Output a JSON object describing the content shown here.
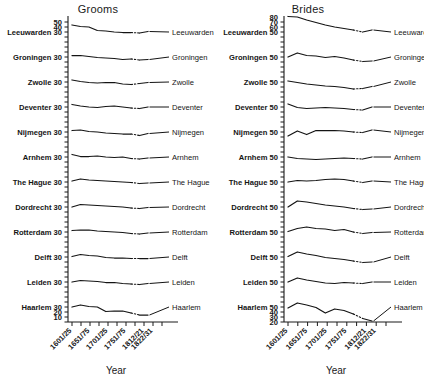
{
  "figure": {
    "background": "#ffffff",
    "ink_color": "#141414",
    "xlabel": "Year"
  },
  "panels": [
    {
      "key": "grooms",
      "title": "Grooms"
    },
    {
      "key": "brides",
      "title": "Brides"
    }
  ],
  "cities": [
    "Leeuwarden",
    "Groningen",
    "Zwolle",
    "Deventer",
    "Nijmegen",
    "Arnhem",
    "The Hague",
    "Dordrecht",
    "Rotterdam",
    "Delft",
    "Leiden",
    "Haarlem"
  ],
  "x_tick_labels": [
    "1601/25",
    "1651/75",
    "1701/25",
    "1751/75",
    "1812/21",
    "1822/31"
  ],
  "x_all_periods": [
    "1601/25",
    "1626/50",
    "1651/75",
    "1676/1700",
    "1701/25",
    "1726/50",
    "1751/75",
    "1776/1800",
    "1812/21",
    "1822/31"
  ],
  "chart_data": {
    "type": "line",
    "xlabel": "Year",
    "ylabel": "",
    "grid": false,
    "legend": "right-inline-labels",
    "x": [
      "1601/25",
      "1626/50",
      "1651/75",
      "1676/1700",
      "1701/25",
      "1726/50",
      "1751/75",
      "1776/1800",
      "1812/21",
      "1822/31"
    ],
    "x_tick_labels": [
      "1601/25",
      "1651/75",
      "1701/25",
      "1751/75",
      "1812/21",
      "1822/31"
    ],
    "panels": [
      {
        "name": "Grooms",
        "ylim": [
          10,
          55
        ],
        "yticks_labeled": [
          50,
          40,
          30
        ],
        "ytick_note": "Each city strip repeats a '30' reference tick; Leeuwarden strip also shows 50 and 40; Haarlem strip shows 30, 20, 10.",
        "series": [
          {
            "name": "Leeuwarden",
            "offset_label": 30,
            "values": [
              44,
              41,
              40,
              33,
              32,
              30,
              29,
              29,
              28,
              31
            ]
          },
          {
            "name": "Groningen",
            "offset_label": 30,
            "values": [
              33,
              33,
              31,
              29,
              28,
              27,
              25,
              26,
              24,
              25
            ]
          },
          {
            "name": "Zwolle",
            "offset_label": 30,
            "values": [
              34,
              31,
              29,
              28,
              29,
              29,
              26,
              25,
              27,
              29
            ]
          },
          {
            "name": "Deventer",
            "offset_label": 30,
            "values": [
              35,
              32,
              30,
              29,
              31,
              32,
              30,
              28,
              27,
              30
            ]
          },
          {
            "name": "Nijmegen",
            "offset_label": 30,
            "values": [
              33,
              34,
              31,
              30,
              28,
              27,
              26,
              26,
              23,
              27
            ]
          },
          {
            "name": "Arnhem",
            "offset_label": 30,
            "values": [
              35,
              31,
              31,
              32,
              30,
              29,
              30,
              27,
              26,
              28
            ]
          },
          {
            "name": "The Hague",
            "offset_label": 30,
            "values": [
              32,
              36,
              34,
              33,
              32,
              31,
              30,
              29,
              27,
              28
            ]
          },
          {
            "name": "Dordrecht",
            "offset_label": 30,
            "values": [
              30,
              35,
              34,
              33,
              32,
              31,
              30,
              28,
              27,
              29
            ]
          },
          {
            "name": "Rotterdam",
            "offset_label": 30,
            "values": [
              33,
              34,
              34,
              32,
              31,
              30,
              29,
              27,
              26,
              28
            ]
          },
          {
            "name": "Delft",
            "offset_label": 30,
            "values": [
              31,
              35,
              33,
              32,
              29,
              28,
              28,
              27,
              27,
              27
            ]
          },
          {
            "name": "Leiden",
            "offset_label": 30,
            "values": [
              30,
              33,
              32,
              31,
              29,
              29,
              27,
              26,
              25,
              27
            ]
          },
          {
            "name": "Haarlem",
            "offset_label": 30,
            "values": [
              30,
              34,
              31,
              30,
              21,
              22,
              22,
              18,
              14,
              14
            ]
          }
        ]
      },
      {
        "name": "Brides",
        "ylim": [
          20,
          85
        ],
        "yticks_labeled": [
          80,
          70,
          60,
          50
        ],
        "ytick_note": "Each city strip repeats a '50' reference tick; Leeuwarden strip also shows 80, 70, 60; Haarlem strip shows 50, 40, 30, 20.",
        "series": [
          {
            "name": "Leeuwarden",
            "offset_label": 50,
            "values": [
              81,
              80,
              74,
              69,
              64,
              60,
              57,
              54,
              50,
              54
            ]
          },
          {
            "name": "Groningen",
            "offset_label": 50,
            "values": [
              50,
              58,
              53,
              52,
              49,
              51,
              48,
              44,
              41,
              42
            ]
          },
          {
            "name": "Zwolle",
            "offset_label": 50,
            "values": [
              52,
              49,
              46,
              44,
              42,
              41,
              39,
              36,
              37,
              41
            ]
          },
          {
            "name": "Deventer",
            "offset_label": 50,
            "values": [
              56,
              49,
              47,
              48,
              49,
              48,
              47,
              45,
              44,
              50
            ]
          },
          {
            "name": "Nijmegen",
            "offset_label": 50,
            "values": [
              42,
              52,
              45,
              53,
              53,
              53,
              52,
              50,
              49,
              54
            ]
          },
          {
            "name": "Arnhem",
            "offset_label": 50,
            "values": [
              50,
              47,
              46,
              45,
              46,
              47,
              48,
              47,
              46,
              50
            ]
          },
          {
            "name": "The Hague",
            "offset_label": 50,
            "values": [
              50,
              53,
              52,
              53,
              55,
              56,
              55,
              52,
              49,
              52
            ]
          },
          {
            "name": "Dordrecht",
            "offset_label": 50,
            "values": [
              50,
              62,
              60,
              57,
              54,
              52,
              50,
              47,
              45,
              46
            ]
          },
          {
            "name": "Rotterdam",
            "offset_label": 50,
            "values": [
              51,
              57,
              60,
              57,
              56,
              53,
              55,
              50,
              47,
              49
            ]
          },
          {
            "name": "Delft",
            "offset_label": 50,
            "values": [
              51,
              60,
              56,
              53,
              49,
              47,
              45,
              42,
              39,
              40
            ]
          },
          {
            "name": "Leiden",
            "offset_label": 50,
            "values": [
              50,
              58,
              54,
              51,
              48,
              47,
              49,
              48,
              47,
              50
            ]
          },
          {
            "name": "Haarlem",
            "offset_label": 50,
            "values": [
              48,
              58,
              54,
              49,
              38,
              46,
              43,
              36,
              27,
              22
            ]
          }
        ]
      }
    ]
  }
}
